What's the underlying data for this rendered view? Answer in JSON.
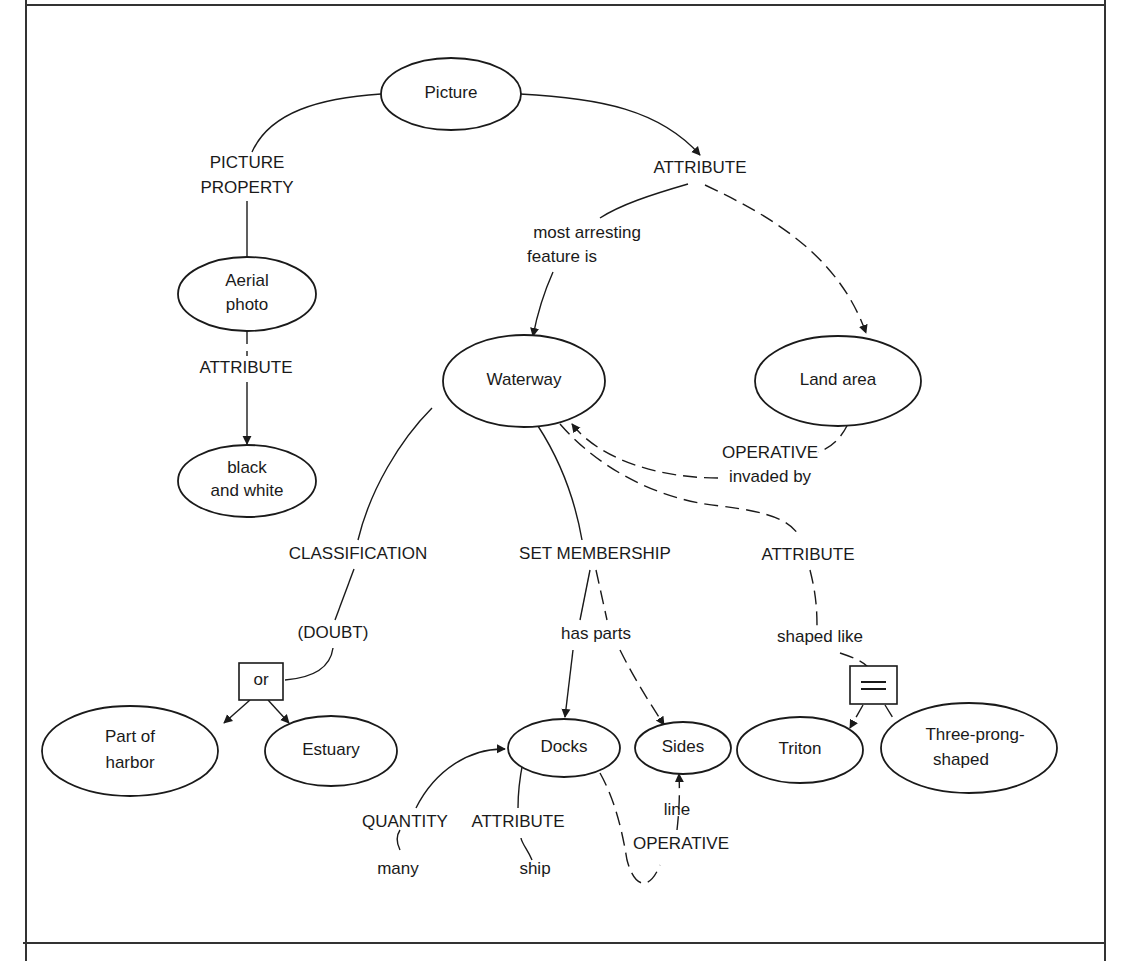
{
  "nodes": {
    "picture": "Picture",
    "aerial_photo": [
      "Aerial",
      "photo"
    ],
    "black_and_white": [
      "black",
      "and white"
    ],
    "waterway": "Waterway",
    "land_area": "Land area",
    "part_of_harbor": [
      "Part of",
      "harbor"
    ],
    "estuary": "Estuary",
    "docks": "Docks",
    "sides": "Sides",
    "triton": "Triton",
    "three_prong_shaped": [
      "Three-prong-",
      "shaped"
    ]
  },
  "boxes": {
    "or": "or",
    "equals": "="
  },
  "labels": {
    "picture_property": [
      "PICTURE",
      "PROPERTY"
    ],
    "attribute_top": "ATTRIBUTE",
    "most_arresting": [
      "most arresting",
      "feature is"
    ],
    "attribute_aerial": "ATTRIBUTE",
    "operative_invaded": [
      "OPERATIVE",
      "invaded by"
    ],
    "classification": "CLASSIFICATION",
    "doubt": "(DOUBT)",
    "set_membership": "SET MEMBERSHIP",
    "has_parts": "has parts",
    "attribute_right": "ATTRIBUTE",
    "shaped_like": "shaped like",
    "quantity": "QUANTITY",
    "many": "many",
    "attribute_docks": "ATTRIBUTE",
    "ship": "ship",
    "line": "line",
    "operative_bottom": "OPERATIVE"
  },
  "colors": {
    "ink": "#1a1a1a",
    "paper": "#ffffff",
    "frame": "#333333"
  }
}
